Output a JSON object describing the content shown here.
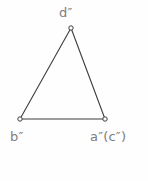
{
  "diagram": {
    "type": "geometric-projection-triangle",
    "background_color": "#fefefe",
    "stroke_color": "#3d3d3d",
    "label_color": "#7d7d7d",
    "vertex_marker": "open-circle",
    "vertex_marker_radius": 2.2,
    "stroke_width": 1.1,
    "vertices": [
      {
        "id": "d",
        "label": "d″",
        "x": 71,
        "y": 28
      },
      {
        "id": "b",
        "label": "b″",
        "x": 20,
        "y": 119
      },
      {
        "id": "ac",
        "label": "a″(c″)",
        "x": 105,
        "y": 119
      }
    ],
    "edges": [
      {
        "from": "b",
        "to": "d"
      },
      {
        "from": "d",
        "to": "ac"
      },
      {
        "from": "b",
        "to": "ac"
      }
    ],
    "labels": {
      "apex": "d″",
      "bottom_left": "b″",
      "bottom_right": "a″(c″)"
    }
  }
}
